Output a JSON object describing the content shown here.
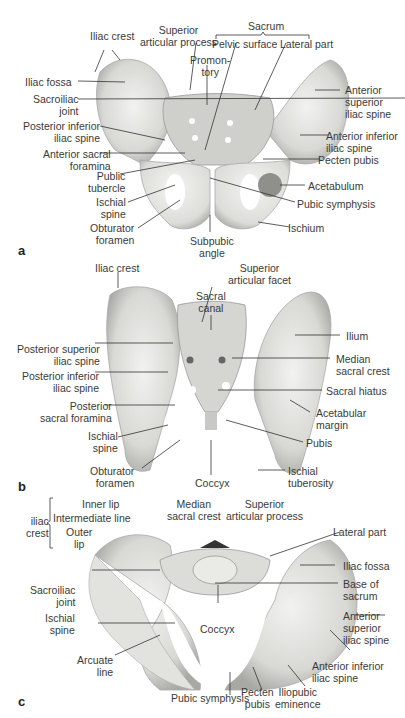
{
  "figure": {
    "panels": [
      {
        "letter": "a",
        "view": "anterior",
        "labels": {
          "iliac_crest": "Iliac crest",
          "superior_articular_process": "Superior\narticular process",
          "sacrum": "Sacrum",
          "pelvic_surface": "Pelvic surface",
          "lateral_part": "Lateral part",
          "promontory": "Promon-\ntory",
          "iliac_fossa": "Iliac fossa",
          "sacroiliac_joint": "Sacroiliac\njoint",
          "anterior_superior_iliac_spine": "Anterior\nsuperior\niliac spine",
          "posterior_inferior_iliac_spine": "Posterior inferior\niliac spine",
          "anterior_inferior_iliac_spine": "Anterior inferior\niliac spine",
          "anterior_sacral_foramina": "Anterior sacral\nforamina",
          "pecten_pubis": "Pecten pubis",
          "public_tubercle": "Public\ntubercle",
          "acetabulum": "Acetabulum",
          "ischial_spine": "Ischial\nspine",
          "pubic_symphysis": "Pubic symphysis",
          "obturator_foramen": "Obturator\nforamen",
          "subpubic_angle": "Subpubic\nangle",
          "ischium": "Ischium"
        }
      },
      {
        "letter": "b",
        "view": "posterior",
        "labels": {
          "iliac_crest": "Iliac crest",
          "superior_articular_facet": "Superior\narticular facet",
          "sacral_canal": "Sacral\ncanal",
          "ilium": "Ilium",
          "posterior_superior_iliac_spine": "Posterior superior\niliac spine",
          "median_sacral_crest": "Median\nsacral crest",
          "posterior_inferior_iliac_spine": "Posterior inferior\niliac spine",
          "sacral_hiatus": "Sacral hiatus",
          "posterior_sacral_foramina": "Posterior\nsacral foramina",
          "acetabular_margin": "Acetabular\nmargin",
          "ischial_spine": "Ischial\nspine",
          "pubis": "Pubis",
          "obturator_foramen": "Obturator\nforamen",
          "coccyx": "Coccyx",
          "ischial_tuberosity": "Ischial\ntuberosity"
        }
      },
      {
        "letter": "c",
        "view": "superior",
        "labels": {
          "iliac_crest": "iliac\ncrest",
          "inner_lip": "Inner lip",
          "intermediate_line": "Intermediate line",
          "outer_lip": "Outer\nlip",
          "median_sacral_crest": "Median\nsacral crest",
          "superior_articular_process": "Superior\narticular process",
          "lateral_part": "Lateral part",
          "iliac_fossa": "Iliac fossa",
          "sacroiliac_joint": "Sacroiliac\njoint",
          "base_of_sacrum": "Base of\nsacrum",
          "ischial_spine": "Ischial\nspine",
          "coccyx": "Coccyx",
          "anterior_superior_iliac_spine": "Anterior\nsuperior\niliac spine",
          "arcuate_line": "Arcuate\nline",
          "anterior_inferior_iliac_spine": "Anterior inferior\niliac spine",
          "pubic_symphysis": "Pubic symphysis",
          "pecten_pubis": "Pecten\npubis",
          "iliopubic_eminence": "Iliopubic\neminence"
        }
      }
    ]
  },
  "colors": {
    "bone_light": "#eeeeec",
    "bone_mid": "#d2d2cf",
    "bone_dark": "#9c9c98",
    "leader": "#333333",
    "text": "#3a3a3a"
  }
}
